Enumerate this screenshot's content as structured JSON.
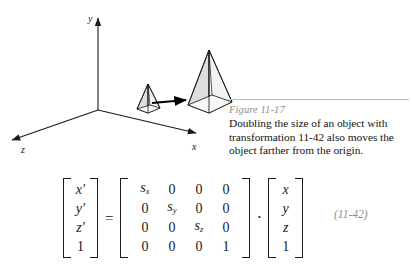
{
  "figure": {
    "axes": {
      "y_label": "y",
      "x_label": "x",
      "z_label": "z"
    },
    "objects": {
      "small_pyramid_name": "small-pyramid",
      "large_pyramid_name": "large-pyramid",
      "arrow_name": "transformation-arrow"
    },
    "colors": {
      "stroke": "#1a1a1a",
      "face_fill": "#d9d9d9",
      "face_fill_light": "#ededed"
    }
  },
  "caption": {
    "figure_label": "Figure 11-17",
    "text": "Doubling the size of an object with transformation 11-42 also moves the object farther from the origin."
  },
  "equation": {
    "number": "(11-42)",
    "equals": "=",
    "dot": "·",
    "lhs_vector": [
      "x′",
      "y′",
      "z′",
      "1"
    ],
    "matrix_rows": [
      [
        "s",
        "0",
        "0",
        "0"
      ],
      [
        "0",
        "s",
        "0",
        "0"
      ],
      [
        "0",
        "0",
        "s",
        "0"
      ],
      [
        "0",
        "0",
        "0",
        "1"
      ]
    ],
    "matrix_display": [
      [
        {
          "base": "s",
          "sub": "x"
        },
        {
          "base": "0",
          "sub": ""
        },
        {
          "base": "0",
          "sub": ""
        },
        {
          "base": "0",
          "sub": ""
        }
      ],
      [
        {
          "base": "0",
          "sub": ""
        },
        {
          "base": "s",
          "sub": "y"
        },
        {
          "base": "0",
          "sub": ""
        },
        {
          "base": "0",
          "sub": ""
        }
      ],
      [
        {
          "base": "0",
          "sub": ""
        },
        {
          "base": "0",
          "sub": ""
        },
        {
          "base": "s",
          "sub": "z"
        },
        {
          "base": "0",
          "sub": ""
        }
      ],
      [
        {
          "base": "0",
          "sub": ""
        },
        {
          "base": "0",
          "sub": ""
        },
        {
          "base": "0",
          "sub": ""
        },
        {
          "base": "1",
          "sub": ""
        }
      ]
    ],
    "rhs_vector": [
      "x",
      "y",
      "z",
      "1"
    ]
  }
}
